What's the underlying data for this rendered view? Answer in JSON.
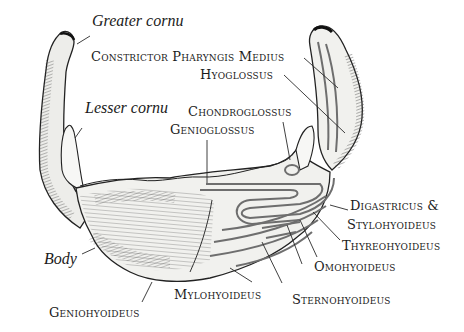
{
  "diagram": {
    "labels": {
      "greater_cornu": "Greater cornu",
      "lesser_cornu": "Lesser cornu",
      "body": "Body",
      "constrictor_pharyngis_medius": "Constrictor Pharyngis Medius",
      "hyoglossus": "Hyoglossus",
      "chondroglossus": "Chondroglossus",
      "genioglossus": "Genioglossus",
      "digastricus_stylohyoideus_1": "Digastricus &",
      "digastricus_stylohyoideus_2": "Stylohyoideus",
      "thyreohyoideus": "Thyreohyoideus",
      "omohyoideus": "Omohyoideus",
      "sternohyoideus": "Sternohyoideus",
      "mylohyoideus": "Mylohyoideus",
      "geniohyoideus": "Geniohyoideus"
    },
    "colors": {
      "ink": "#1b1b1b",
      "bone_fill": "#f4f4f2",
      "shade": "#8a8a8a",
      "muscle_outline": "#6e6e6e"
    }
  }
}
